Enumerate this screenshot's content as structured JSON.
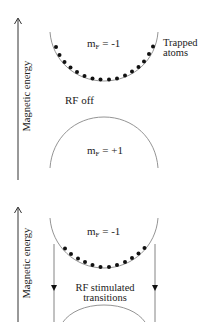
{
  "panels": [
    {
      "id": "rf-off",
      "axis_label": "Magnetic energy",
      "upper_state": {
        "label_main": "m",
        "label_sub": "F",
        "label_value": " = -1"
      },
      "lower_state": {
        "label_main": "m",
        "label_sub": "F",
        "label_value": " = +1"
      },
      "annotation": "RF off",
      "side_label": [
        "Trapped",
        "atoms"
      ]
    },
    {
      "id": "rf-on",
      "axis_label": "Magnetic energy",
      "upper_state": {
        "label_main": "m",
        "label_sub": "F",
        "label_value": " = -1"
      },
      "annotation": [
        "RF stimulated",
        "transitions"
      ]
    }
  ],
  "colors": {
    "line": "#777777",
    "dot": "#111111",
    "text": "#222222"
  }
}
